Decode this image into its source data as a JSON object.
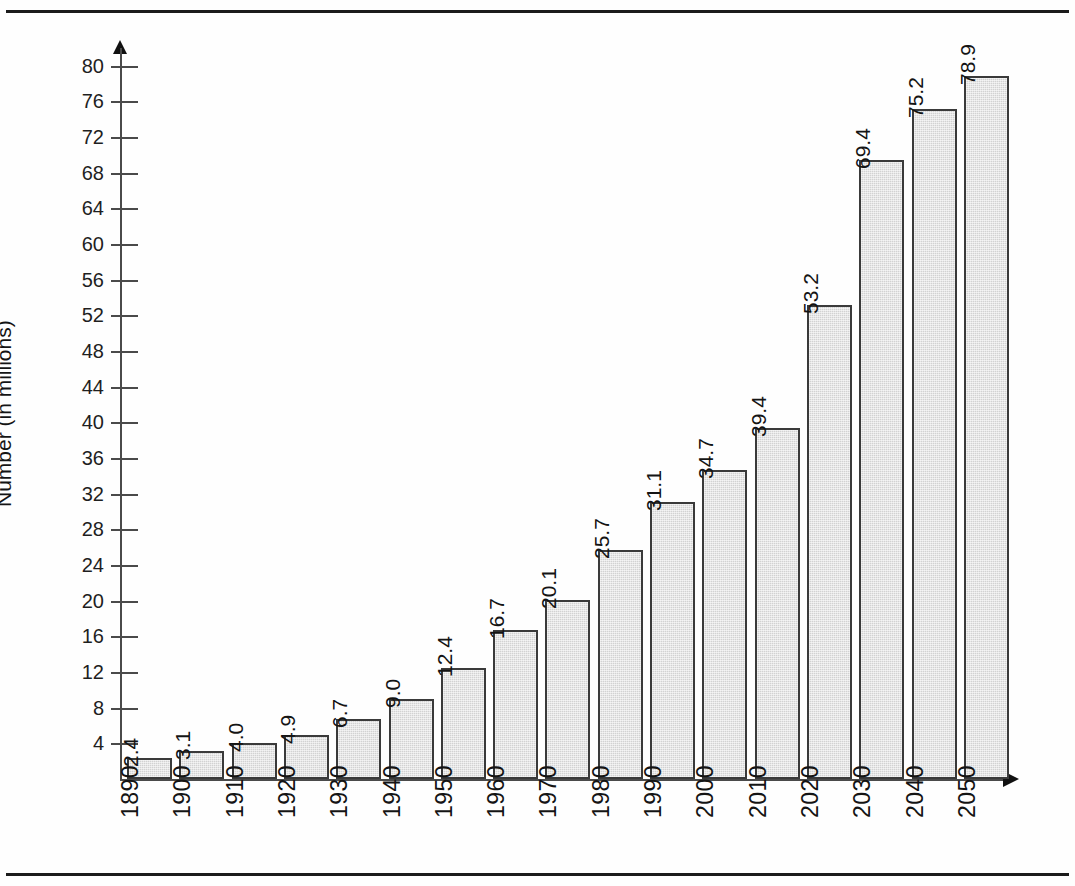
{
  "frame": {
    "clipped_header_text": "",
    "top_rule": "top-rule",
    "bottom_rule": "bottom-rule"
  },
  "chart_data": {
    "type": "bar",
    "title": "",
    "xlabel": "",
    "ylabel": "Number (in millions)",
    "categories": [
      "1890",
      "1900",
      "1910",
      "1920",
      "1930",
      "1940",
      "1950",
      "1960",
      "1970",
      "1980",
      "1990",
      "2000",
      "2010",
      "2020",
      "2030",
      "2040",
      "2050"
    ],
    "values": [
      2.4,
      3.1,
      4.0,
      4.9,
      6.7,
      9.0,
      12.4,
      16.7,
      20.1,
      25.7,
      31.1,
      34.7,
      39.4,
      53.2,
      69.4,
      75.2,
      78.9
    ],
    "value_labels": [
      "2.4",
      "3.1",
      "4.0",
      "4.9",
      "6.7",
      "9.0",
      "12.4",
      "16.7",
      "20.1",
      "25.7",
      "31.1",
      "34.7",
      "39.4",
      "53.2",
      "69.4",
      "75.2",
      "78.9"
    ],
    "ylim": [
      0,
      82
    ],
    "ytick_values": [
      4,
      8,
      12,
      16,
      20,
      24,
      28,
      32,
      36,
      40,
      44,
      48,
      52,
      56,
      60,
      64,
      68,
      72,
      76,
      80
    ],
    "ytick_labels": [
      "4",
      "8",
      "12",
      "16",
      "20",
      "24",
      "28",
      "32",
      "36",
      "40",
      "44",
      "48",
      "52",
      "56",
      "60",
      "64",
      "68",
      "72",
      "76",
      "80"
    ],
    "grid": false,
    "legend": null,
    "bar_fill_color": "#d2d2d2",
    "bar_edge_color": "#3a3a3a",
    "axis_color": "#4a4a4a",
    "text_color": "#141414"
  }
}
